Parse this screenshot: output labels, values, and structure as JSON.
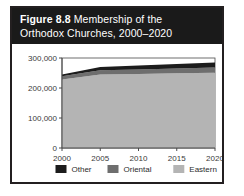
{
  "figure": {
    "label": "Figure 8.8",
    "title_line1_rest": " Membership of the",
    "title_line2": "Orthodox Churches, 2000–2020"
  },
  "colors": {
    "title_band": "#1a1a1a",
    "border": "#231f20",
    "other": "#1c1c1c",
    "oriental": "#6e6e6e",
    "eastern": "#b4b4b4",
    "axis": "#4a4a4a",
    "plot_background": "#ffffff"
  },
  "chart_data": {
    "type": "area",
    "stacked": true,
    "title": "Figure 8.8 Membership of the Orthodox Churches, 2000–2020",
    "xlabel": "",
    "ylabel": "",
    "x": [
      2000,
      2005,
      2010,
      2015,
      2020
    ],
    "categories": [
      "2000",
      "2005",
      "2010",
      "2015",
      "2020"
    ],
    "xlim": [
      2000,
      2020
    ],
    "ylim": [
      0,
      300000
    ],
    "yticks": [
      0,
      100000,
      200000,
      300000
    ],
    "ytick_labels": [
      "0",
      "100,000",
      "200,000",
      "300,000"
    ],
    "xticks": [
      2000,
      2005,
      2010,
      2015,
      2020
    ],
    "xtick_labels": [
      "2000",
      "2005",
      "2010",
      "2015",
      "2020"
    ],
    "grid": false,
    "legend_position": "bottom",
    "series": [
      {
        "name": "Eastern",
        "color": "#b4b4b4",
        "values": [
          228000,
          245000,
          247000,
          249000,
          251000
        ]
      },
      {
        "name": "Oriental",
        "color": "#6e6e6e",
        "values": [
          11000,
          14000,
          15000,
          16000,
          17000
        ]
      },
      {
        "name": "Other",
        "color": "#1c1c1c",
        "values": [
          6000,
          11000,
          13000,
          15000,
          17000
        ]
      }
    ],
    "totals": [
      245000,
      270000,
      275000,
      280000,
      285000
    ]
  },
  "legend": {
    "items": [
      {
        "label": "Other",
        "color": "#1c1c1c"
      },
      {
        "label": "Oriental",
        "color": "#6e6e6e"
      },
      {
        "label": "Eastern",
        "color": "#b4b4b4"
      }
    ]
  }
}
